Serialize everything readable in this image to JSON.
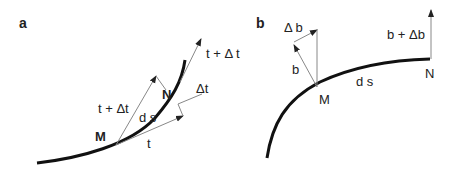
{
  "panels": {
    "a": {
      "label": "a",
      "curve": "curve",
      "labels": {
        "M": "M",
        "N": "N",
        "ds": "d s",
        "t": "t",
        "t_plus_dt_at_M": "t + Δt",
        "t_plus_dt_at_N": "t + Δ t",
        "dt": "Δt"
      }
    },
    "b": {
      "label": "b",
      "labels": {
        "M": "M",
        "N": "N",
        "ds": "d s",
        "b": "b",
        "db": "Δ b",
        "b_plus_db": "b + Δb"
      }
    }
  },
  "colors": {
    "curve": "#111111",
    "vector": "#888888",
    "text": "#222222"
  }
}
